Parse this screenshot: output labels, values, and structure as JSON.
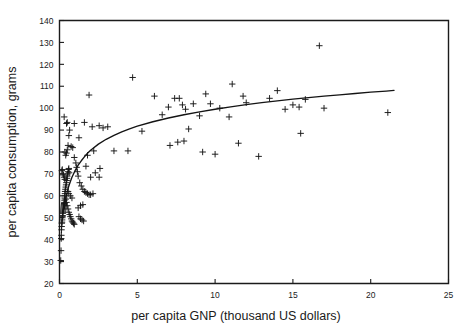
{
  "chart_data": {
    "type": "scatter",
    "title": "",
    "xlabel": "per capita GNP (thousand US dollars)",
    "ylabel": "per capita consumption, grams",
    "xlim": [
      0,
      25
    ],
    "ylim": [
      20,
      140
    ],
    "xticks": [
      0,
      5,
      10,
      15,
      20,
      25
    ],
    "yticks": [
      20,
      30,
      40,
      50,
      60,
      70,
      80,
      90,
      100,
      110,
      120,
      130,
      140
    ],
    "xtick_labels": [
      "0",
      "5",
      "10",
      "15",
      "20",
      "25"
    ],
    "ytick_labels": [
      "20",
      "30",
      "40",
      "50",
      "60",
      "70",
      "80",
      "90",
      "100",
      "110",
      "120",
      "130",
      "140"
    ],
    "grid": false,
    "legend": null,
    "marker_style": "plus",
    "marker_color": "#161616",
    "curve_color": "#141414",
    "frame_color": "#1b1b1b",
    "background_color": "#ffffff",
    "series": [
      {
        "name": "countries",
        "type": "scatter",
        "points": [
          [
            0.08,
            30.5
          ],
          [
            0.1,
            35.0
          ],
          [
            0.11,
            40.5
          ],
          [
            0.12,
            42.0
          ],
          [
            0.13,
            44.5
          ],
          [
            0.14,
            46.0
          ],
          [
            0.15,
            47.5
          ],
          [
            0.16,
            48.0
          ],
          [
            0.17,
            49.0
          ],
          [
            0.18,
            50.0
          ],
          [
            0.19,
            50.5
          ],
          [
            0.2,
            51.0
          ],
          [
            0.21,
            52.0
          ],
          [
            0.22,
            52.5
          ],
          [
            0.23,
            53.0
          ],
          [
            0.24,
            53.5
          ],
          [
            0.25,
            54.0
          ],
          [
            0.26,
            54.5
          ],
          [
            0.27,
            55.0
          ],
          [
            0.28,
            55.5
          ],
          [
            0.29,
            56.0
          ],
          [
            0.3,
            56.5
          ],
          [
            0.31,
            57.0
          ],
          [
            0.32,
            58.0
          ],
          [
            0.33,
            59.0
          ],
          [
            0.34,
            60.0
          ],
          [
            0.35,
            61.0
          ],
          [
            0.36,
            62.0
          ],
          [
            0.38,
            63.0
          ],
          [
            0.4,
            64.0
          ],
          [
            0.42,
            65.0
          ],
          [
            0.44,
            66.0
          ],
          [
            0.46,
            67.0
          ],
          [
            0.48,
            68.0
          ],
          [
            0.5,
            69.0
          ],
          [
            0.52,
            70.0
          ],
          [
            0.55,
            71.0
          ],
          [
            0.58,
            72.0
          ],
          [
            0.6,
            72.5
          ],
          [
            0.62,
            70.5
          ],
          [
            0.15,
            71.5
          ],
          [
            0.18,
            72.0
          ],
          [
            0.22,
            70.0
          ],
          [
            0.26,
            69.5
          ],
          [
            0.3,
            68.5
          ],
          [
            0.34,
            67.5
          ],
          [
            0.4,
            58.5
          ],
          [
            0.45,
            57.0
          ],
          [
            0.5,
            55.5
          ],
          [
            0.55,
            54.0
          ],
          [
            0.6,
            52.5
          ],
          [
            0.65,
            51.5
          ],
          [
            0.7,
            50.5
          ],
          [
            0.75,
            49.5
          ],
          [
            0.8,
            48.5
          ],
          [
            0.85,
            48.0
          ],
          [
            0.9,
            47.5
          ],
          [
            0.95,
            47.0
          ],
          [
            0.55,
            62.0
          ],
          [
            0.6,
            61.0
          ],
          [
            0.7,
            60.0
          ],
          [
            0.8,
            59.0
          ],
          [
            0.35,
            80.0
          ],
          [
            0.4,
            78.5
          ],
          [
            0.45,
            79.5
          ],
          [
            0.5,
            81.0
          ],
          [
            0.55,
            83.0
          ],
          [
            0.6,
            87.5
          ],
          [
            0.45,
            93.0
          ],
          [
            0.5,
            93.5
          ],
          [
            0.3,
            96.0
          ],
          [
            0.65,
            90.0
          ],
          [
            0.75,
            82.5
          ],
          [
            0.85,
            82.0
          ],
          [
            0.95,
            77.5
          ],
          [
            1.05,
            75.0
          ],
          [
            1.1,
            73.0
          ],
          [
            1.15,
            71.0
          ],
          [
            1.2,
            69.0
          ],
          [
            1.3,
            66.0
          ],
          [
            1.4,
            64.5
          ],
          [
            1.5,
            63.0
          ],
          [
            1.6,
            62.0
          ],
          [
            1.7,
            61.5
          ],
          [
            1.8,
            61.0
          ],
          [
            1.9,
            60.5
          ],
          [
            2.0,
            60.5
          ],
          [
            2.15,
            61.0
          ],
          [
            1.25,
            86.5
          ],
          [
            1.6,
            93.5
          ],
          [
            2.1,
            91.5
          ],
          [
            2.55,
            92.0
          ],
          [
            1.9,
            106.0
          ],
          [
            1.2,
            54.5
          ],
          [
            1.35,
            55.5
          ],
          [
            1.5,
            56.0
          ],
          [
            1.25,
            50.5
          ],
          [
            1.35,
            49.5
          ],
          [
            1.45,
            49.0
          ],
          [
            1.55,
            48.5
          ],
          [
            2.3,
            70.5
          ],
          [
            2.55,
            68.5
          ],
          [
            2.0,
            68.5
          ],
          [
            1.7,
            73.5
          ],
          [
            1.8,
            78.5
          ],
          [
            2.2,
            80.5
          ],
          [
            3.5,
            80.5
          ],
          [
            4.4,
            80.5
          ],
          [
            4.7,
            114.0
          ],
          [
            6.1,
            105.5
          ],
          [
            7.0,
            100.5
          ],
          [
            7.4,
            104.5
          ],
          [
            7.7,
            104.5
          ],
          [
            7.9,
            101.5
          ],
          [
            8.1,
            99.5
          ],
          [
            8.6,
            102.0
          ],
          [
            8.3,
            90.5
          ],
          [
            7.6,
            84.5
          ],
          [
            7.1,
            83.0
          ],
          [
            8.0,
            85.0
          ],
          [
            9.4,
            106.5
          ],
          [
            9.0,
            96.5
          ],
          [
            9.7,
            102.0
          ],
          [
            10.3,
            100.0
          ],
          [
            11.1,
            111.0
          ],
          [
            11.8,
            105.5
          ],
          [
            12.0,
            102.5
          ],
          [
            10.9,
            96.0
          ],
          [
            9.2,
            80.0
          ],
          [
            10.0,
            79.0
          ],
          [
            11.5,
            84.0
          ],
          [
            12.8,
            78.0
          ],
          [
            13.5,
            104.5
          ],
          [
            14.0,
            108.0
          ],
          [
            14.5,
            99.5
          ],
          [
            15.0,
            101.5
          ],
          [
            15.4,
            100.5
          ],
          [
            15.8,
            104.0
          ],
          [
            15.5,
            88.5
          ],
          [
            16.7,
            128.5
          ],
          [
            17.0,
            100.0
          ],
          [
            21.1,
            98.0
          ],
          [
            6.6,
            97.0
          ],
          [
            5.3,
            89.5
          ],
          [
            3.1,
            91.5
          ],
          [
            2.8,
            91.0
          ],
          [
            2.6,
            72.5
          ],
          [
            0.95,
            93.0
          ]
        ]
      },
      {
        "name": "fitted curve",
        "type": "line",
        "description": "logarithmic fit through scatter",
        "points": [
          [
            0.3,
            54.0
          ],
          [
            0.4,
            58.5
          ],
          [
            0.5,
            62.0
          ],
          [
            0.6,
            64.5
          ],
          [
            0.7,
            66.5
          ],
          [
            0.8,
            68.5
          ],
          [
            0.9,
            70.0
          ],
          [
            1.0,
            71.5
          ],
          [
            1.2,
            74.0
          ],
          [
            1.4,
            76.0
          ],
          [
            1.6,
            77.8
          ],
          [
            1.8,
            79.4
          ],
          [
            2.0,
            80.8
          ],
          [
            2.5,
            83.6
          ],
          [
            3.0,
            85.8
          ],
          [
            3.5,
            87.6
          ],
          [
            4.0,
            89.2
          ],
          [
            4.5,
            90.6
          ],
          [
            5.0,
            91.8
          ],
          [
            6.0,
            93.8
          ],
          [
            7.0,
            95.5
          ],
          [
            8.0,
            97.0
          ],
          [
            9.0,
            98.3
          ],
          [
            10.0,
            99.5
          ],
          [
            11.0,
            100.6
          ],
          [
            12.0,
            101.6
          ],
          [
            13.0,
            102.5
          ],
          [
            14.0,
            103.3
          ],
          [
            15.0,
            104.1
          ],
          [
            16.0,
            104.8
          ],
          [
            17.0,
            105.5
          ],
          [
            18.0,
            106.1
          ],
          [
            19.0,
            106.7
          ],
          [
            20.0,
            107.3
          ],
          [
            21.0,
            107.8
          ],
          [
            21.5,
            108.1
          ]
        ]
      }
    ]
  },
  "axes": {
    "x_title": "per capita GNP (thousand US dollars)",
    "y_title": "per capita consumption, grams"
  }
}
